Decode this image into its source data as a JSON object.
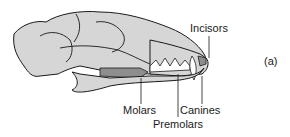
{
  "figure": {
    "panel_label": "(a)",
    "labels": {
      "incisors": "Incisors",
      "canines": "Canines",
      "premolars": "Premolars",
      "molars": "Molars"
    },
    "colors": {
      "bone": "#d6d6d6",
      "outline": "#1a1a1a",
      "molar_fill": "#8e8e8e",
      "premolar_fill": "#ffffff"
    }
  }
}
